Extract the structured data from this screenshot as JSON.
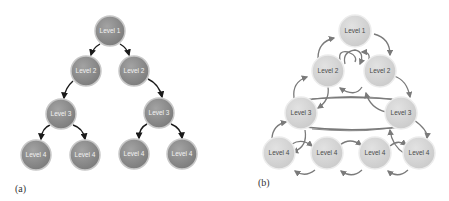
{
  "diagrams": [
    {
      "id": "a",
      "caption": "(a)",
      "style": {
        "node_fill": "#8a8a8a",
        "node_stroke": "#bdbdbd",
        "label_color": "#f2f2f2",
        "edge_color": "#1a1a1a"
      },
      "nodes": [
        {
          "label": "Level 1",
          "x": 110,
          "y": 31
        },
        {
          "label": "Level 2",
          "x": 86,
          "y": 71
        },
        {
          "label": "Level 2",
          "x": 134,
          "y": 71
        },
        {
          "label": "Level 3",
          "x": 61,
          "y": 114
        },
        {
          "label": "Level 3",
          "x": 159,
          "y": 113
        },
        {
          "label": "Level 4",
          "x": 36,
          "y": 155
        },
        {
          "label": "Level 4",
          "x": 85,
          "y": 155
        },
        {
          "label": "Level 4",
          "x": 134,
          "y": 154
        },
        {
          "label": "Level 4",
          "x": 182,
          "y": 154
        }
      ],
      "edges": [
        [
          0,
          1
        ],
        [
          0,
          2
        ],
        [
          1,
          3
        ],
        [
          2,
          4
        ],
        [
          3,
          5
        ],
        [
          3,
          6
        ],
        [
          4,
          7
        ],
        [
          4,
          8
        ]
      ]
    },
    {
      "id": "b",
      "caption": "(b)",
      "style": {
        "node_fill": "#d4d4d4",
        "node_stroke": "#e8e8e8",
        "label_color": "#4a4a4a",
        "edge_color": "#7a7a7a"
      },
      "nodes": [
        {
          "label": "Level 1",
          "x": 355,
          "y": 31
        },
        {
          "label": "Level 2",
          "x": 328,
          "y": 71
        },
        {
          "label": "Level 2",
          "x": 380,
          "y": 71
        },
        {
          "label": "Level 3",
          "x": 301,
          "y": 113
        },
        {
          "label": "Level 3",
          "x": 401,
          "y": 113
        },
        {
          "label": "Level 4",
          "x": 279,
          "y": 153
        },
        {
          "label": "Level 4",
          "x": 327,
          "y": 153
        },
        {
          "label": "Level 4",
          "x": 375,
          "y": 153
        },
        {
          "label": "Level 4",
          "x": 419,
          "y": 153
        }
      ]
    }
  ]
}
